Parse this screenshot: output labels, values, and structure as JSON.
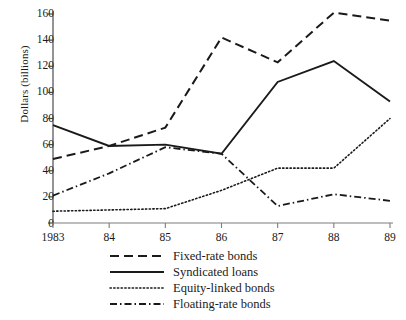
{
  "chart_data": {
    "type": "line",
    "title": "",
    "xlabel": "",
    "ylabel": "Dollars (billions)",
    "categories": [
      "1983",
      "84",
      "85",
      "86",
      "87",
      "88",
      "89"
    ],
    "x": [
      1983,
      1984,
      1985,
      1986,
      1987,
      1988,
      1989
    ],
    "xlim": [
      1983,
      1989
    ],
    "ylim": [
      0,
      160
    ],
    "yticks": [
      0,
      20,
      40,
      60,
      80,
      100,
      120,
      140,
      160
    ],
    "grid": false,
    "legend_position": "below-axes",
    "series": [
      {
        "name": "Fixed-rate bonds",
        "style": "dashed",
        "color": "#1a1a1a",
        "values": [
          49,
          59,
          73,
          142,
          123,
          161,
          155
        ]
      },
      {
        "name": "Syndicated loans",
        "style": "solid",
        "color": "#1a1a1a",
        "values": [
          75,
          59,
          60,
          53,
          108,
          124,
          93
        ]
      },
      {
        "name": "Equity-linked bonds",
        "style": "dotted",
        "color": "#1a1a1a",
        "values": [
          9,
          10,
          11,
          25,
          42,
          42,
          80
        ]
      },
      {
        "name": "Floating-rate bonds",
        "style": "dash-dot",
        "color": "#1a1a1a",
        "values": [
          21,
          38,
          58,
          53,
          13,
          22,
          17
        ]
      }
    ]
  },
  "axis": {
    "ytick_labels": [
      "160",
      "140",
      "120",
      "100",
      "80",
      "60",
      "40",
      "20",
      "0"
    ],
    "xtick_labels": [
      "1983",
      "84",
      "85",
      "86",
      "87",
      "88",
      "89"
    ],
    "ylabel": "Dollars (billions)"
  },
  "legend": {
    "items": [
      {
        "label": "Fixed-rate bonds",
        "style": "dashed"
      },
      {
        "label": "Syndicated loans",
        "style": "solid"
      },
      {
        "label": "Equity-linked bonds",
        "style": "dotted"
      },
      {
        "label": "Floating-rate bonds",
        "style": "dash-dot"
      }
    ]
  }
}
